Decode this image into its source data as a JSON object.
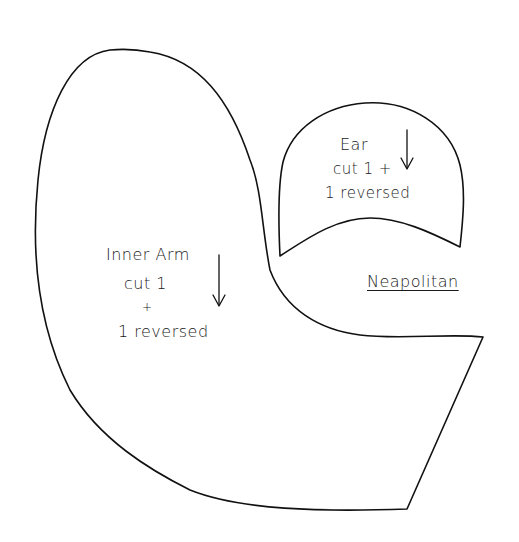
{
  "pattern": {
    "name": "Neapolitan",
    "colors": {
      "line": "#111111",
      "background": "#ffffff"
    },
    "pieces": [
      {
        "id": "inner-arm",
        "title": "Inner Arm",
        "instructions": [
          "cut 1",
          "+",
          "1 reversed"
        ],
        "grain_arrow": "down"
      },
      {
        "id": "ear",
        "title": "Ear",
        "instructions": [
          "cut 1 +",
          "1 reversed"
        ],
        "grain_arrow": "down"
      }
    ]
  }
}
